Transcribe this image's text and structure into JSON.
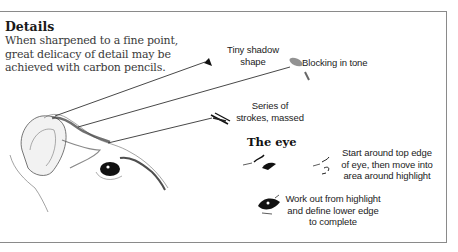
{
  "intro": {
    "title": "Details",
    "body_lines": [
      "When sharpened to a fine point,",
      "great delicacy of detail may be",
      "achieved with carbon pencils."
    ]
  },
  "callouts": {
    "tiny_shadow": [
      "Tiny shadow",
      "shape"
    ],
    "blocking": [
      "Blocking in tone"
    ],
    "series": [
      "Series of",
      "strokes, massed"
    ]
  },
  "eye_section": {
    "title": "The eye",
    "steps": [
      {
        "lines": [
          "Start around top edge",
          "of eye, then move into",
          "area around highlight"
        ]
      },
      {
        "lines": [
          "Work out from highlight",
          "and define lower edge",
          "to complete"
        ]
      }
    ]
  },
  "colors": {
    "frame": "#8a8a8a",
    "text": "#222222",
    "ink": "#1a1a1a"
  }
}
